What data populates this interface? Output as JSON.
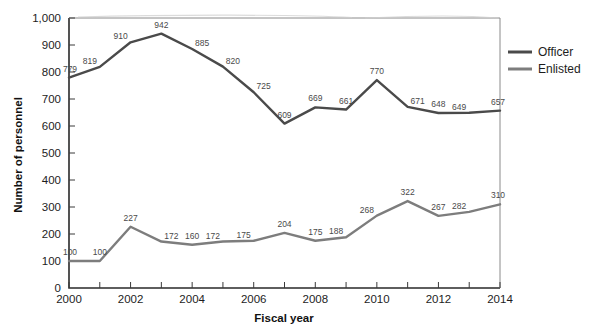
{
  "chart_data": {
    "type": "line",
    "title": "",
    "xlabel": "Fiscal year",
    "ylabel": "Number of personnel",
    "x": [
      2000,
      2001,
      2002,
      2003,
      2004,
      2005,
      2006,
      2007,
      2008,
      2009,
      2010,
      2011,
      2012,
      2013,
      2014
    ],
    "xtick_labels": [
      "2000",
      "2002",
      "2004",
      "2006",
      "2008",
      "2010",
      "2012",
      "2014"
    ],
    "xtick_values": [
      2000,
      2002,
      2004,
      2006,
      2008,
      2010,
      2012,
      2014
    ],
    "xlim": [
      2000,
      2014
    ],
    "ylim": [
      0,
      1000
    ],
    "ytick_labels": [
      "0",
      "100",
      "200",
      "300",
      "400",
      "500",
      "600",
      "700",
      "800",
      "900",
      "1,000"
    ],
    "ytick_values": [
      0,
      100,
      200,
      300,
      400,
      500,
      600,
      700,
      800,
      900,
      1000
    ],
    "grid": false,
    "legend_position": "right",
    "series": [
      {
        "name": "Officer",
        "color": "#4a4a4a",
        "values": [
          779,
          819,
          910,
          942,
          885,
          820,
          725,
          609,
          669,
          661,
          770,
          671,
          648,
          649,
          657
        ],
        "labels": [
          "779",
          "819",
          "910",
          "942",
          "885",
          "820",
          "725",
          "609",
          "669",
          "661",
          "770",
          "671",
          "648",
          "649",
          "657"
        ]
      },
      {
        "name": "Enlisted",
        "color": "#7d7d7d",
        "values": [
          100,
          100,
          227,
          172,
          160,
          172,
          175,
          204,
          175,
          188,
          268,
          322,
          267,
          282,
          310
        ],
        "labels": [
          "100",
          "100",
          "227",
          "172",
          "160",
          "172",
          "175",
          "204",
          "175",
          "188",
          "268",
          "322",
          "267",
          "282",
          "310"
        ]
      }
    ]
  },
  "legend": {
    "items": [
      {
        "label": "Officer",
        "color": "#4a4a4a"
      },
      {
        "label": "Enlisted",
        "color": "#7d7d7d"
      }
    ]
  }
}
